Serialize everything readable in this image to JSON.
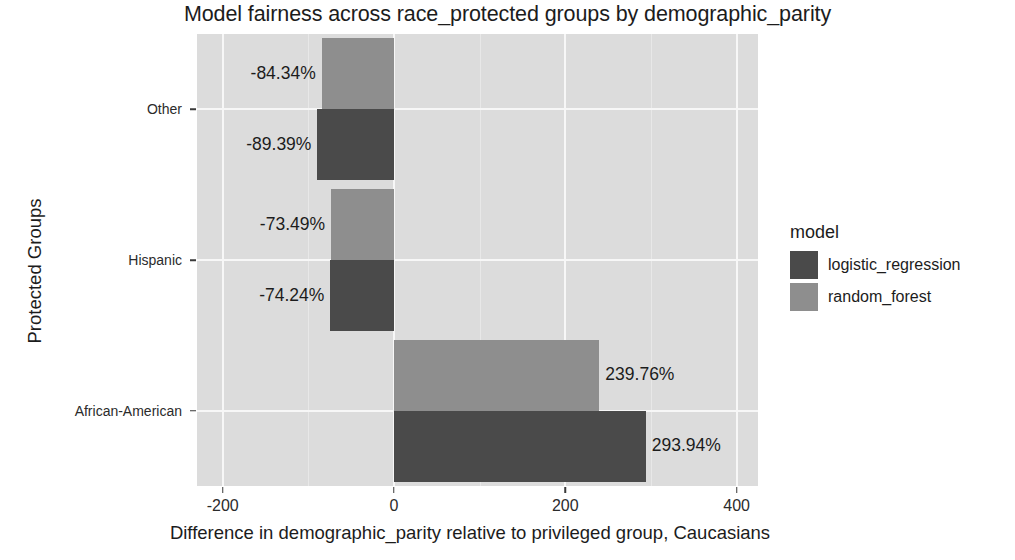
{
  "chart_data": {
    "type": "bar",
    "orientation": "horizontal",
    "title": "Model fairness across race_protected groups by demographic_parity",
    "xlabel": "Difference in demographic_parity relative to privileged group, Caucasians",
    "ylabel": "Protected Groups",
    "categories": [
      "African-American",
      "Hispanic",
      "Other"
    ],
    "series": [
      {
        "name": "logistic_regression",
        "color": "#4a4a4a",
        "values": [
          293.94,
          -74.24,
          -89.39
        ],
        "labels": [
          "293.94%",
          "-74.24%",
          "-89.39%"
        ]
      },
      {
        "name": "random_forest",
        "color": "#8e8e8e",
        "values": [
          239.76,
          -73.49,
          -84.34
        ],
        "labels": [
          "239.76%",
          "-73.49%",
          "-84.34%"
        ]
      }
    ],
    "xlim": [
      -230,
      425
    ],
    "xticks": [
      -200,
      0,
      200,
      400
    ],
    "xtick_labels": [
      "-200",
      "0",
      "200",
      "400"
    ],
    "grid": true,
    "legend_title": "model",
    "legend_position": "right",
    "panel_background": "#dcdcdc",
    "gridline_color": "#f7f7f7"
  },
  "axis": {
    "y_ticks": [
      {
        "label": "African-American"
      },
      {
        "label": "Hispanic"
      },
      {
        "label": "Other"
      }
    ]
  },
  "legend": {
    "title": "model",
    "items": [
      {
        "label": "logistic_regression",
        "color": "#4a4a4a"
      },
      {
        "label": "random_forest",
        "color": "#8e8e8e"
      }
    ]
  }
}
